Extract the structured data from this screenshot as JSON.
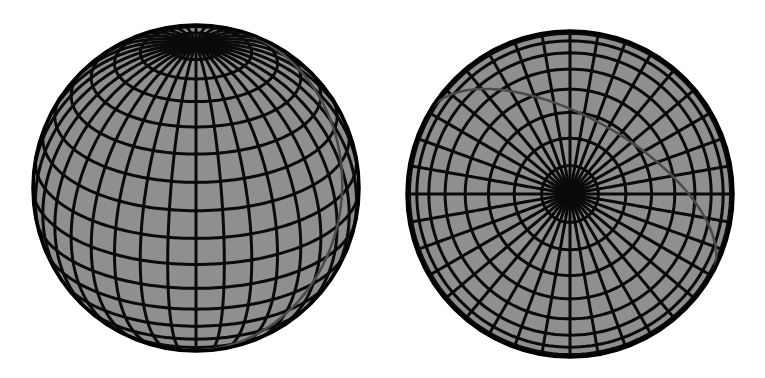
{
  "figure": {
    "width": 765,
    "height": 378,
    "background": "#ffffff",
    "colors": {
      "sphere_fill": "#8f8f8f",
      "grid_line": "#0a0a0a",
      "great_circle": "#4a4a4a",
      "outline": "#000000"
    },
    "panels": [
      {
        "name": "oblique-view-sphere",
        "description": "Latitude-longitude grid sphere seen obliquely with north pole near top, with a tilted great circle",
        "center": [
          196,
          188
        ],
        "radius": 163,
        "view_latitude_deg": 28,
        "meridian_count": 36,
        "parallel_step_deg": 10,
        "great_circle_tilt_deg": 35
      },
      {
        "name": "polar-view-sphere",
        "description": "Same sphere viewed from directly above the pole, showing radial meridians and concentric parallels, with the great circle appearing as an arc through near the pole",
        "center": [
          570,
          194
        ],
        "radius": 163,
        "view_latitude_deg": 90,
        "meridian_count": 36,
        "parallel_step_deg": 10
      }
    ]
  }
}
